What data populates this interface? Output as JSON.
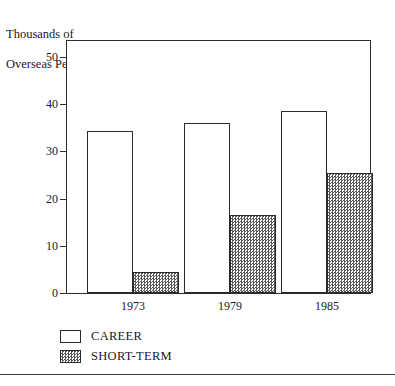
{
  "chart_data": {
    "type": "bar",
    "title": "",
    "ylabel": "Thousands of\nOverseas Personnel",
    "ylabel_line1": "Thousands of",
    "ylabel_line2": "Overseas Personnel",
    "xlabel": "",
    "categories": [
      "1973",
      "1979",
      "1985"
    ],
    "series": [
      {
        "name": "CAREER",
        "values": [
          34.3,
          36.1,
          38.5
        ],
        "fill": "white"
      },
      {
        "name": "SHORT-TERM",
        "values": [
          4.5,
          16.5,
          25.5
        ],
        "fill": "hatched-gray"
      }
    ],
    "ylim": [
      0,
      50
    ],
    "yticks": [
      0,
      10,
      20,
      30,
      40,
      50
    ],
    "ytick_labels": [
      "0",
      "10",
      "20",
      "30",
      "40",
      "50"
    ],
    "grid": false,
    "legend_position": "bottom-left",
    "frame": true
  },
  "legend": {
    "items": [
      {
        "label": "CAREER",
        "swatch": "white"
      },
      {
        "label": "SHORT-TERM",
        "swatch": "hatched-gray"
      }
    ]
  },
  "colors": {
    "line": "#2b2b2b",
    "text": "#1a1a1a",
    "hatch": "#5a5a5a",
    "background": "#ffffff"
  }
}
